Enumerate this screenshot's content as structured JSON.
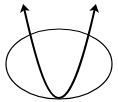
{
  "diagram": {
    "stroke_color": "#000000",
    "background": "#ffffff",
    "ellipse": {
      "cx": 59,
      "cy": 64,
      "rx": 53,
      "ry": 35,
      "stroke_width": 1.2
    },
    "parabola": {
      "vertex": [
        59,
        98
      ],
      "left_tip": [
        24,
        6
      ],
      "right_tip": [
        95,
        6
      ],
      "stroke_width": 2,
      "arrowheads": [
        "left-end",
        "right-end"
      ]
    }
  }
}
